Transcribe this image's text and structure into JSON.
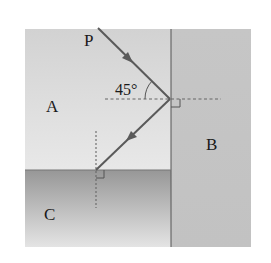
{
  "diagram": {
    "type": "optics-reflection",
    "regions": [
      {
        "id": "A",
        "label": "A",
        "description": "upper-left medium"
      },
      {
        "id": "B",
        "label": "B",
        "description": "right medium"
      },
      {
        "id": "C",
        "label": "C",
        "description": "lower-left medium"
      }
    ],
    "ray": {
      "start_label": "P",
      "angle_label": "45°",
      "angle_deg": 45
    },
    "colors": {
      "region_a_top": "#d2d2d2",
      "region_a_bottom": "#e8e8e8",
      "region_b": "#c4c4c4",
      "region_c_top": "#979797",
      "region_c_bottom": "#e4e4e4",
      "ray": "#5a5a5a",
      "boundary": "#555555",
      "normal": "#666666"
    }
  }
}
